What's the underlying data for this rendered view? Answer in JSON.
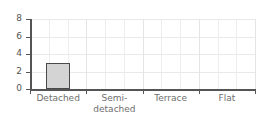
{
  "chart_data": {
    "type": "bar",
    "title": "",
    "subtitle": "",
    "xlabel": "",
    "ylabel": "",
    "categories": [
      "Detached",
      "Semi-detached",
      "Terrace",
      "Flat"
    ],
    "category_labels_display": [
      "Detached",
      "Semi-\ndetached",
      "Terrace",
      "Flat"
    ],
    "values": [
      3,
      0,
      0,
      0
    ],
    "ylim": [
      0,
      8
    ],
    "yticks": [
      0,
      2,
      4,
      6,
      8
    ],
    "ytick_labels": [
      "0",
      "2",
      "4",
      "6",
      "8"
    ],
    "grid": true,
    "grid_color": "#e9e9e9",
    "legend": false,
    "legend_position": "none",
    "bar_fill_color": "#d4d4d4",
    "bar_edge_color": "#4a4a4a",
    "axis_color": "#555555",
    "text_color": "#6e6e6e",
    "background_color": "#ffffff"
  }
}
